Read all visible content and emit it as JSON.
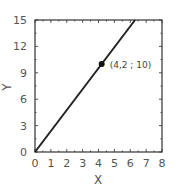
{
  "chart_data": {
    "type": "line",
    "title": "",
    "xlabel": "X",
    "ylabel": "Y",
    "xlim": [
      0,
      8
    ],
    "ylim": [
      0,
      15
    ],
    "xticks": [
      0,
      1,
      2,
      3,
      4,
      5,
      6,
      7,
      8
    ],
    "yticks": [
      0,
      3,
      6,
      9,
      12,
      15
    ],
    "grid": false,
    "legend": null,
    "series": [
      {
        "name": "line",
        "x": [
          0,
          6.3
        ],
        "y": [
          0,
          15
        ],
        "color": "#222222"
      }
    ],
    "points": [
      {
        "x": 4.2,
        "y": 10,
        "label": "(4,2 ; 10)"
      }
    ],
    "annotations": [
      {
        "text": "(4,2 ; 10)",
        "x": 4.2,
        "y": 10
      }
    ]
  },
  "labels": {
    "xlabel": "X",
    "ylabel": "Y",
    "point_label": "(4,2 ; 10)",
    "xticks": [
      "0",
      "1",
      "2",
      "3",
      "4",
      "5",
      "6",
      "7",
      "8"
    ],
    "yticks": [
      "0",
      "3",
      "6",
      "9",
      "12",
      "15"
    ]
  }
}
